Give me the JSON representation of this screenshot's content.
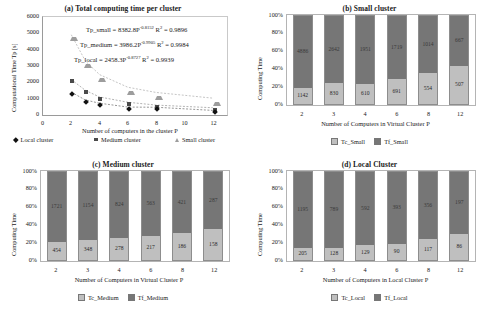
{
  "colors": {
    "light_fill": "#bfbfbf",
    "dark_fill": "#767676",
    "border": "#8d8d8d",
    "axis": "#9a9a9a",
    "text": "#1a1a1a",
    "marker_local": "#111111",
    "marker_medium": "#4a4a4a",
    "marker_small": "#9d9d9d"
  },
  "chart_data": [
    {
      "id": "a",
      "type": "scatter",
      "title": "(a) Total computing time per cluster",
      "xlabel": "Number of computers in the cluster P",
      "ylabel": "Computational Time Tp [s]",
      "xlim": [
        0,
        13
      ],
      "ylim": [
        0,
        6000
      ],
      "xticks": [
        "0",
        "2",
        "4",
        "6",
        "8",
        "10",
        "12"
      ],
      "xtick_values": [
        0,
        2,
        4,
        6,
        8,
        10,
        12
      ],
      "yticks": [
        "0",
        "1000",
        "2000",
        "3000",
        "4000",
        "5000",
        "6000"
      ],
      "ytick_values": [
        0,
        1000,
        2000,
        3000,
        4000,
        5000,
        6000
      ],
      "grid": false,
      "legend_position": "bottom",
      "x": [
        2,
        3,
        4,
        6,
        8,
        12
      ],
      "series": [
        {
          "name": "Local cluster",
          "marker": "diamond",
          "values": [
            1400,
            917,
            721,
            483,
            473,
            283
          ]
        },
        {
          "name": "Medium cluster",
          "marker": "square",
          "values": [
            2175,
            1502,
            1102,
            780,
            607,
            445
          ]
        },
        {
          "name": "Small cluster",
          "marker": "triangle",
          "values": [
            4915,
            3300,
            2470,
            1700,
            1380,
            1030
          ]
        }
      ],
      "annotations": [
        {
          "prefix": "Tp_small = 8382.8P",
          "exp": "-0.8152",
          "suffix": "R",
          "sup": "2",
          "tail": " = 0.9896"
        },
        {
          "prefix": "Tp_medium = 3986.2P",
          "exp": "-0.9905",
          "suffix": "R",
          "sup": "2",
          "tail": " = 0.9984"
        },
        {
          "prefix": "Tp_local = 2458.3P",
          "exp": "-0.8727",
          "suffix": "R",
          "sup": "2",
          "tail": " = 0.9939"
        }
      ]
    },
    {
      "id": "b",
      "type": "bar",
      "stacked": true,
      "normalized": true,
      "title": "(b) Small cluster",
      "xlabel": "Number of Computers in Virtual Cluster  P",
      "ylabel": "Computing Time",
      "categories": [
        "2",
        "3",
        "4",
        "6",
        "8",
        "12"
      ],
      "yticks": [
        "0%",
        "20%",
        "40%",
        "60%",
        "80%",
        "100%"
      ],
      "ytick_values": [
        0,
        20,
        40,
        60,
        80,
        100
      ],
      "grid": false,
      "legend_position": "bottom",
      "series": [
        {
          "name": "Tc_Small",
          "values": [
            1142,
            830,
            610,
            691,
            554,
            507
          ]
        },
        {
          "name": "Tf_Small",
          "values": [
            4886,
            2642,
            1951,
            1719,
            1014,
            667
          ]
        }
      ]
    },
    {
      "id": "c",
      "type": "bar",
      "stacked": true,
      "normalized": true,
      "title": "(c) Medium cluster",
      "xlabel": "Number of Computers in Virtual Cluster P",
      "ylabel": "Computing Time",
      "categories": [
        "2",
        "3",
        "4",
        "6",
        "8",
        "12"
      ],
      "yticks": [
        "0%",
        "20%",
        "40%",
        "60%",
        "80%",
        "100%"
      ],
      "ytick_values": [
        0,
        20,
        40,
        60,
        80,
        100
      ],
      "grid": false,
      "legend_position": "bottom",
      "series": [
        {
          "name": "Tc_Medium",
          "values": [
            454,
            348,
            278,
            217,
            186,
            158
          ]
        },
        {
          "name": "Tf_Medium",
          "values": [
            1721,
            1154,
            824,
            563,
            421,
            287
          ]
        }
      ]
    },
    {
      "id": "d",
      "type": "bar",
      "stacked": true,
      "normalized": true,
      "title": "(d) Local Cluster",
      "xlabel": "Number of Computers in Local Cluster P",
      "ylabel": "Computing Time",
      "categories": [
        "2",
        "3",
        "4",
        "6",
        "8",
        "12"
      ],
      "yticks": [
        "0%",
        "20%",
        "40%",
        "60%",
        "80%",
        "100%"
      ],
      "ytick_values": [
        0,
        20,
        40,
        60,
        80,
        100
      ],
      "grid": false,
      "legend_position": "bottom",
      "series": [
        {
          "name": "Tc_Local",
          "values": [
            205,
            128,
            129,
            90,
            117,
            86
          ]
        },
        {
          "name": "Tf_Local",
          "values": [
            1195,
            789,
            592,
            393,
            356,
            197
          ]
        }
      ]
    }
  ]
}
